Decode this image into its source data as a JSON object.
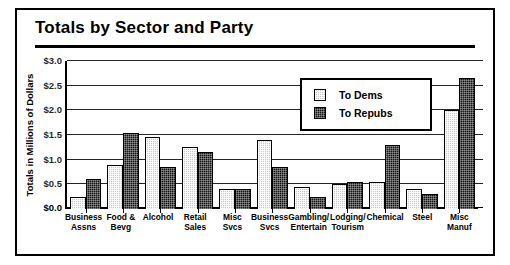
{
  "chart_data": {
    "type": "bar",
    "title": "Totals by Sector and Party",
    "xlabel": "",
    "ylabel": "Totals in Millions of Dollars",
    "ylim": [
      0.0,
      3.0
    ],
    "ytick_step": 0.5,
    "ytick_labels": [
      "$0.0",
      "$0.5",
      "$1.0",
      "$1.5",
      "$2.0",
      "$2.5",
      "$3.0"
    ],
    "ytick_values": [
      0.0,
      0.5,
      1.0,
      1.5,
      2.0,
      2.5,
      3.0
    ],
    "grid": true,
    "legend_position": "upper-center-right",
    "categories": [
      "Business Assns",
      "Food & Bevg",
      "Alcohol",
      "Retail Sales",
      "Misc Svcs",
      "Business Svcs",
      "Gambling/ Entertain",
      "Lodging/ Tourism",
      "Chemical",
      "Steel",
      "Misc Manuf"
    ],
    "category_lines": [
      [
        "Business",
        "Assns"
      ],
      [
        "Food &",
        "Bevg"
      ],
      [
        "Alcohol",
        ""
      ],
      [
        "Retail",
        "Sales"
      ],
      [
        "Misc Svcs",
        ""
      ],
      [
        "Business",
        "Svcs"
      ],
      [
        "Gambling/",
        "Entertain"
      ],
      [
        "Lodging/",
        "Tourism"
      ],
      [
        "Chemical",
        ""
      ],
      [
        "Steel",
        ""
      ],
      [
        "Misc",
        "Manuf"
      ]
    ],
    "series": [
      {
        "name": "To Dems",
        "color": "#c9c9c9",
        "values": [
          0.25,
          0.9,
          1.45,
          1.25,
          0.4,
          1.4,
          0.45,
          0.5,
          0.55,
          0.4,
          2.0
        ]
      },
      {
        "name": "To Repubs",
        "color": "#141414",
        "values": [
          0.6,
          1.55,
          0.85,
          1.15,
          0.4,
          0.85,
          0.25,
          0.55,
          1.3,
          0.3,
          2.65
        ]
      }
    ]
  },
  "legend": {
    "items": [
      {
        "label": "To Dems"
      },
      {
        "label": "To Repubs"
      }
    ]
  }
}
